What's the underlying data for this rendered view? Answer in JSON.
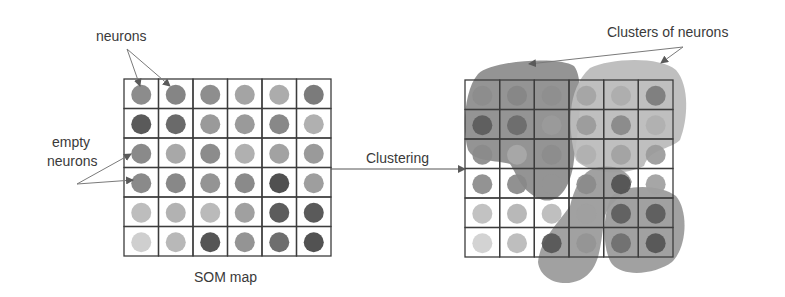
{
  "labels": {
    "neurons": "neurons",
    "empty_line1": "empty",
    "empty_line2": "neurons",
    "clustering": "Clustering",
    "clusters": "Clusters of neurons",
    "som_map": "SOM map"
  },
  "colors": {
    "grid_line": "#3c3c3c",
    "arrow": "#7a7a7a",
    "cluster_dark": "#8a8a8a",
    "cluster_light": "#b9b9b9",
    "cluster_mid": "#9a9a9a"
  },
  "grid": {
    "rows": 6,
    "cols": 6,
    "neuron_shades": [
      [
        "#8c8c8c",
        "#858585",
        "#8e8e8e",
        "#a4a4a4",
        "#acacac",
        "#7b7b7b"
      ],
      [
        "#5a5a5a",
        "#6a6a6a",
        "#9a9a9a",
        "#9a9a9a",
        "#888888",
        "#b0b0b0"
      ],
      [
        "#8a8a8a",
        "#a8a8a8",
        "#8c8c8c",
        "#b0b0b0",
        "#a2a2a2",
        "#9a9a9a"
      ],
      [
        "#8a8a8a",
        "#888888",
        "#949494",
        "#8a8a8a",
        "#505050",
        "#9e9e9e"
      ],
      [
        "#bdbdbd",
        "#b2b2b2",
        "#bababa",
        "#a0a0a0",
        "#5c5c5c",
        "#5a5a5a"
      ],
      [
        "#cfcfcf",
        "#b8b8b8",
        "#555555",
        "#949494",
        "#6e6e6e",
        "#525252"
      ]
    ]
  }
}
